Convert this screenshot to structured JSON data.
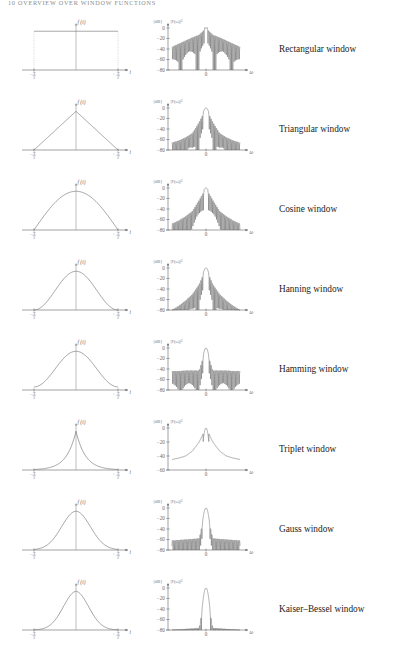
{
  "running_head": "10   OVERVIEW OVER WINDOW FUNCTIONS",
  "axes": {
    "time": {
      "ylabel": "f (t)",
      "xlabel": "t",
      "xtick_left": "−",
      "xtick_right": "+",
      "tick_numerator": "T",
      "tick_denominator": "2"
    },
    "freq": {
      "unit": "[dB]",
      "ylabel": "|F(ω)|²",
      "xlabel": "ω",
      "xtick_center": "0",
      "yticks_full": [
        "0",
        "−20",
        "−40",
        "−60",
        "−80"
      ],
      "yticks_short": [
        "0",
        "−20",
        "−40",
        "−60"
      ]
    }
  },
  "chart_data": {
    "type": "line",
    "title": "Overview over window functions",
    "xlabel": "t  /  ω",
    "ylabel": "f(t)  /  |F(ω)|² [dB]",
    "grid": false,
    "legend": "none",
    "panels": [
      {
        "name": "Rectangular window",
        "time": {
          "xlim": [
            -0.5,
            0.5
          ],
          "ylim": [
            0,
            1.15
          ],
          "xtick_labels": [
            "−T/2",
            "+T/2"
          ],
          "shape": "rect",
          "values": [
            {
              "t": -0.5,
              "f": 1.0
            },
            {
              "t": -0.25,
              "f": 1.0
            },
            {
              "t": 0.0,
              "f": 1.0
            },
            {
              "t": 0.25,
              "f": 1.0
            },
            {
              "t": 0.5,
              "f": 1.0
            }
          ]
        },
        "freq": {
          "ylim": [
            -80,
            5
          ],
          "yticks": [
            0,
            -20,
            -40,
            -60,
            -80
          ],
          "mainlobe_half_width_bins": 1.0,
          "first_sidelobe_db": -13,
          "sidelobe_rolloff_db_per_decade": -20,
          "envelope_db": [
            -36,
            -30,
            -24,
            -18,
            -13,
            0,
            -13,
            -18,
            -24,
            -30,
            -36
          ]
        }
      },
      {
        "name": "Triangular window",
        "time": {
          "xlim": [
            -0.5,
            0.5
          ],
          "ylim": [
            0,
            1.15
          ],
          "xtick_labels": [
            "−T/2",
            "+T/2"
          ],
          "shape": "triangle",
          "values": [
            {
              "t": -0.5,
              "f": 0.0
            },
            {
              "t": -0.25,
              "f": 0.5
            },
            {
              "t": 0.0,
              "f": 1.0
            },
            {
              "t": 0.25,
              "f": 0.5
            },
            {
              "t": 0.5,
              "f": 0.0
            }
          ]
        },
        "freq": {
          "ylim": [
            -80,
            5
          ],
          "yticks": [
            0,
            -20,
            -40,
            -60,
            -80
          ],
          "mainlobe_half_width_bins": 2.0,
          "first_sidelobe_db": -27,
          "sidelobe_rolloff_db_per_decade": -40,
          "envelope_db": [
            -66,
            -62,
            -56,
            -48,
            -27,
            0,
            -27,
            -48,
            -56,
            -62,
            -66
          ]
        }
      },
      {
        "name": "Cosine window",
        "time": {
          "xlim": [
            -0.5,
            0.5
          ],
          "ylim": [
            0,
            1.15
          ],
          "xtick_labels": [
            "−T/2",
            "+T/2"
          ],
          "shape": "cosine",
          "values": [
            {
              "t": -0.5,
              "f": 0.0
            },
            {
              "t": -0.25,
              "f": 0.707
            },
            {
              "t": 0.0,
              "f": 1.0
            },
            {
              "t": 0.25,
              "f": 0.707
            },
            {
              "t": 0.5,
              "f": 0.0
            }
          ]
        },
        "freq": {
          "ylim": [
            -80,
            5
          ],
          "yticks": [
            0,
            -20,
            -40,
            -60,
            -80
          ],
          "mainlobe_half_width_bins": 1.5,
          "first_sidelobe_db": -23,
          "sidelobe_rolloff_db_per_decade": -24,
          "envelope_db": [
            -68,
            -62,
            -54,
            -44,
            -23,
            0,
            -23,
            -44,
            -54,
            -62,
            -68
          ]
        }
      },
      {
        "name": "Hanning window",
        "time": {
          "xlim": [
            -0.5,
            0.5
          ],
          "ylim": [
            0,
            1.15
          ],
          "xtick_labels": [
            "−T/2",
            "+T/2"
          ],
          "shape": "hanning",
          "values": [
            {
              "t": -0.5,
              "f": 0.0
            },
            {
              "t": -0.25,
              "f": 0.5
            },
            {
              "t": 0.0,
              "f": 1.0
            },
            {
              "t": 0.25,
              "f": 0.5
            },
            {
              "t": 0.5,
              "f": 0.0
            }
          ]
        },
        "freq": {
          "ylim": [
            -80,
            5
          ],
          "yticks": [
            0,
            -20,
            -40,
            -60,
            -80
          ],
          "mainlobe_half_width_bins": 2.0,
          "first_sidelobe_db": -31,
          "sidelobe_rolloff_db_per_decade": -60,
          "envelope_db": [
            -80,
            -72,
            -62,
            -50,
            -31,
            0,
            -31,
            -50,
            -62,
            -72,
            -80
          ]
        }
      },
      {
        "name": "Hamming window",
        "time": {
          "xlim": [
            -0.5,
            0.5
          ],
          "ylim": [
            0,
            1.15
          ],
          "xtick_labels": [
            "−T/2",
            "+T/2"
          ],
          "shape": "hamming",
          "values": [
            {
              "t": -0.5,
              "f": 0.08
            },
            {
              "t": -0.25,
              "f": 0.54
            },
            {
              "t": 0.0,
              "f": 1.0
            },
            {
              "t": 0.25,
              "f": 0.54
            },
            {
              "t": 0.5,
              "f": 0.08
            }
          ]
        },
        "freq": {
          "ylim": [
            -80,
            5
          ],
          "yticks": [
            0,
            -20,
            -40,
            -60,
            -80
          ],
          "mainlobe_half_width_bins": 2.0,
          "first_sidelobe_db": -43,
          "sidelobe_rolloff_db_per_decade": 0,
          "envelope_db": [
            -44,
            -44,
            -43,
            -43,
            -43,
            0,
            -43,
            -43,
            -43,
            -44,
            -44
          ]
        }
      },
      {
        "name": "Triplet window",
        "time": {
          "xlim": [
            -0.5,
            0.5
          ],
          "ylim": [
            0,
            1.15
          ],
          "xtick_labels": [
            "−T/2",
            "+T/2"
          ],
          "shape": "triplet",
          "values": [
            {
              "t": -0.5,
              "f": 0.03
            },
            {
              "t": -0.25,
              "f": 0.12
            },
            {
              "t": 0.0,
              "f": 1.0
            },
            {
              "t": 0.25,
              "f": 0.12
            },
            {
              "t": 0.5,
              "f": 0.03
            }
          ]
        },
        "freq": {
          "ylim": [
            -60,
            5
          ],
          "yticks": [
            0,
            -20,
            -40,
            -60
          ],
          "mainlobe_half_width_bins": 2.2,
          "first_sidelobe_db": null,
          "sidelobe_rolloff_db_per_decade": -12,
          "envelope_db": [
            -45,
            -43,
            -40,
            -33,
            -20,
            0,
            -20,
            -33,
            -40,
            -43,
            -45
          ]
        }
      },
      {
        "name": "Gauss window",
        "time": {
          "xlim": [
            -0.5,
            0.5
          ],
          "ylim": [
            0,
            1.15
          ],
          "xtick_labels": [
            "−T/2",
            "+T/2"
          ],
          "shape": "gauss",
          "values": [
            {
              "t": -0.5,
              "f": 0.02
            },
            {
              "t": -0.25,
              "f": 0.37
            },
            {
              "t": 0.0,
              "f": 1.0
            },
            {
              "t": 0.25,
              "f": 0.37
            },
            {
              "t": 0.5,
              "f": 0.02
            }
          ]
        },
        "freq": {
          "ylim": [
            -80,
            5
          ],
          "yticks": [
            0,
            -20,
            -40,
            -60,
            -80
          ],
          "mainlobe_half_width_bins": 2.6,
          "first_sidelobe_db": -58,
          "sidelobe_rolloff_db_per_decade": 0,
          "envelope_db": [
            -62,
            -61,
            -60,
            -59,
            -58,
            0,
            -58,
            -59,
            -60,
            -61,
            -62
          ]
        }
      },
      {
        "name": "Kaiser–Bessel window",
        "time": {
          "xlim": [
            -0.5,
            0.5
          ],
          "ylim": [
            0,
            1.15
          ],
          "xtick_labels": [
            "−T/2",
            "+T/2"
          ],
          "shape": "kaiser",
          "values": [
            {
              "t": -0.5,
              "f": 0.01
            },
            {
              "t": -0.25,
              "f": 0.33
            },
            {
              "t": 0.0,
              "f": 1.0
            },
            {
              "t": 0.25,
              "f": 0.33
            },
            {
              "t": 0.5,
              "f": 0.01
            }
          ]
        },
        "freq": {
          "ylim": [
            -80,
            5
          ],
          "yticks": [
            0,
            -20,
            -40,
            -60,
            -80
          ],
          "mainlobe_half_width_bins": 3.0,
          "first_sidelobe_db": -76,
          "sidelobe_rolloff_db_per_decade": 0,
          "envelope_db": [
            -80,
            -79,
            -78,
            -77,
            -76,
            0,
            -76,
            -77,
            -78,
            -79,
            -80
          ]
        }
      }
    ]
  }
}
